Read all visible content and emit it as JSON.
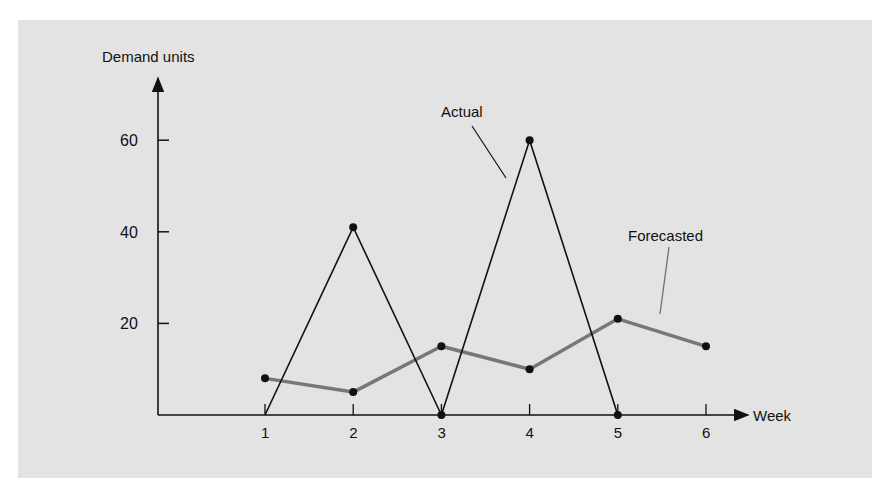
{
  "chart_data": {
    "type": "line",
    "title": "",
    "xlabel": "Week",
    "ylabel": "Demand units",
    "x": [
      1,
      2,
      3,
      4,
      5,
      6
    ],
    "x_ticks": [
      "1",
      "2",
      "3",
      "4",
      "5",
      "6"
    ],
    "y_ticks": [
      "20",
      "40",
      "60"
    ],
    "ylim": [
      0,
      70
    ],
    "grid": false,
    "series": [
      {
        "name": "Actual",
        "x": [
          1,
          2,
          3,
          4,
          5
        ],
        "values": [
          0,
          41,
          0,
          60,
          0
        ],
        "color": "#111111"
      },
      {
        "name": "Forecasted",
        "x": [
          1,
          2,
          3,
          4,
          5,
          6
        ],
        "values": [
          8,
          5,
          15,
          10,
          21,
          15
        ],
        "color": "#777777"
      }
    ],
    "annotations": [
      "Actual",
      "Forecasted"
    ],
    "legend": "inline callout labels"
  },
  "colors": {
    "panel": "#e3e3e3",
    "axis": "#111111",
    "actual": "#111111",
    "forecast": "#777777"
  }
}
